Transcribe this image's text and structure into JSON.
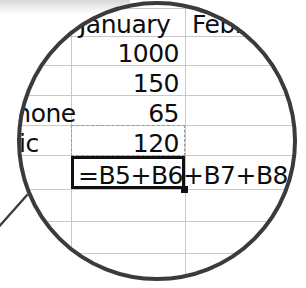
{
  "app": {
    "kind": "spreadsheet-magnified-view",
    "lens_border_color": "#3b3b3b",
    "gridline_color": "#c8c8c8",
    "text_color": "#0d0d0d",
    "selection_color": "#101010",
    "marquee_color": "#9a9a9a"
  },
  "sheet": {
    "column_headers": [
      {
        "label": "January",
        "clipped": false
      },
      {
        "label": "Februar",
        "clipped": true
      }
    ],
    "row_labels": [
      {
        "label": "phone",
        "clipped": true
      },
      {
        "label": "tric",
        "clipped": true
      }
    ],
    "values": [
      {
        "cell": "B5",
        "text": "1000"
      },
      {
        "cell": "B6",
        "text": "150"
      },
      {
        "cell": "B7",
        "text": "65"
      },
      {
        "cell": "B8",
        "text": "120"
      }
    ],
    "active_cell": {
      "reference": "B9",
      "formula": "=B5+B6+B7+B8",
      "has_fill_handle": true
    },
    "copy_marquee": {
      "visible": true,
      "range": "B7:B8"
    }
  }
}
